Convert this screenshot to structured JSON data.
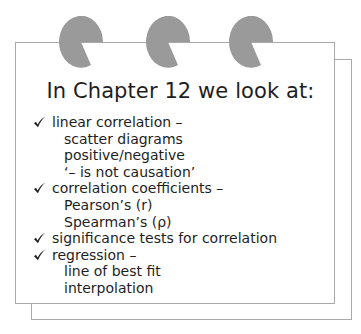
{
  "page": {
    "title": "In Chapter 12 we look at:",
    "binder_rings": [
      {
        "icon": "binder-ring-icon",
        "color": "#999999"
      },
      {
        "icon": "binder-ring-icon",
        "color": "#999999"
      },
      {
        "icon": "binder-ring-icon",
        "color": "#999999"
      }
    ],
    "items": [
      {
        "icon": "checkmark-icon",
        "label": "linear correlation –",
        "sub_items": [
          "scatter diagrams",
          "positive/negative",
          "‘– is not causation’"
        ]
      },
      {
        "icon": "checkmark-icon",
        "label": "correlation coefficients –",
        "sub_items": [
          "Pearson’s (r)",
          "Spearman’s (ρ)"
        ]
      },
      {
        "icon": "checkmark-icon",
        "label": "significance tests for correlation",
        "sub_items": []
      },
      {
        "icon": "checkmark-icon",
        "label": "regression –",
        "sub_items": [
          "line of best fit",
          "interpolation"
        ]
      }
    ],
    "colors": {
      "ring": "#999999",
      "border": "#a9a9a9",
      "text": "#1e1e1e"
    }
  }
}
